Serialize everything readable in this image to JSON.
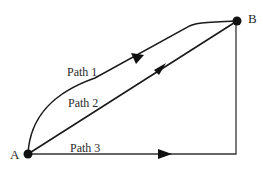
{
  "diagram": {
    "type": "path-diagram",
    "nodes": [
      {
        "id": "A",
        "label": "A",
        "x": 28,
        "y": 154
      },
      {
        "id": "B",
        "label": "B",
        "x": 237,
        "y": 21
      }
    ],
    "paths": [
      {
        "id": "path1",
        "label": "Path 1",
        "from": "A",
        "to": "B",
        "shape": "curved-then-straight"
      },
      {
        "id": "path2",
        "label": "Path 2",
        "from": "A",
        "to": "B",
        "shape": "straight"
      },
      {
        "id": "path3",
        "label": "Path 3",
        "from": "A",
        "to": "B",
        "shape": "right-angle (horizontal then vertical)"
      }
    ],
    "colors": {
      "line": "#1a1a1a",
      "text": "#2a2a2a",
      "background": "#ffffff"
    }
  }
}
